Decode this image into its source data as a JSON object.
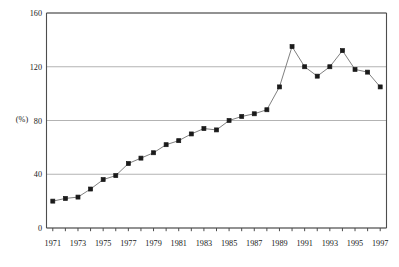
{
  "chart_data": {
    "type": "line",
    "title": "",
    "xlabel": "",
    "ylabel": "(%)",
    "ylim": [
      0,
      160
    ],
    "yticks": [
      0,
      40,
      80,
      120,
      160
    ],
    "ytick_labels": [
      "0",
      "40",
      "80",
      "120",
      "160"
    ],
    "grid": true,
    "legend": "none",
    "x": [
      1971,
      1972,
      1973,
      1974,
      1975,
      1976,
      1977,
      1978,
      1979,
      1980,
      1981,
      1982,
      1983,
      1984,
      1985,
      1986,
      1987,
      1988,
      1989,
      1990,
      1991,
      1992,
      1993,
      1994,
      1995,
      1996,
      1997
    ],
    "xtick_labels": [
      "1971",
      "",
      "1973",
      "",
      "1975",
      "",
      "1977",
      "",
      "1979",
      "",
      "1981",
      "",
      "1983",
      "",
      "1985",
      "",
      "1987",
      "",
      "1989",
      "",
      "1991",
      "",
      "1993",
      "",
      "1995",
      "",
      "1997"
    ],
    "values": [
      20,
      22,
      23,
      29,
      36,
      39,
      48,
      52,
      56,
      62,
      65,
      70,
      74,
      73,
      80,
      83,
      85,
      88,
      105,
      135,
      120,
      113,
      120,
      132,
      118,
      116,
      105
    ],
    "series": [
      {
        "name": "ratio",
        "values": [
          20,
          22,
          23,
          29,
          36,
          39,
          48,
          52,
          56,
          62,
          65,
          70,
          74,
          73,
          80,
          83,
          85,
          88,
          105,
          135,
          120,
          113,
          120,
          132,
          118,
          116,
          105
        ]
      }
    ],
    "marker": "filled-square",
    "line_color": "#808080",
    "marker_color": "#1a1a1a",
    "grid_color": "#b3b3b3",
    "axis_color": "#4d4d4d"
  }
}
